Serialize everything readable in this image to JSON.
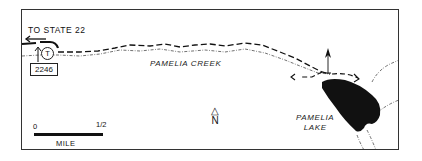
{
  "map": {
    "highway_label": "TO STATE 22",
    "trailhead_marker": "T",
    "trail_number": "2246",
    "creek_label": "PAMELIA CREEK",
    "lake_label_line1": "PAMELIA",
    "lake_label_line2": "LAKE",
    "north_arrow_symbol": "△",
    "north_label": "N",
    "scale": {
      "start": "0",
      "end": "1/2",
      "unit": "MILE"
    },
    "colors": {
      "ink": "#111111",
      "background": "#ffffff",
      "frame": "#333333"
    },
    "icons": [
      "trailhead-icon",
      "campsite-tent-icon",
      "north-arrow-icon",
      "direction-arrow-icon"
    ]
  }
}
